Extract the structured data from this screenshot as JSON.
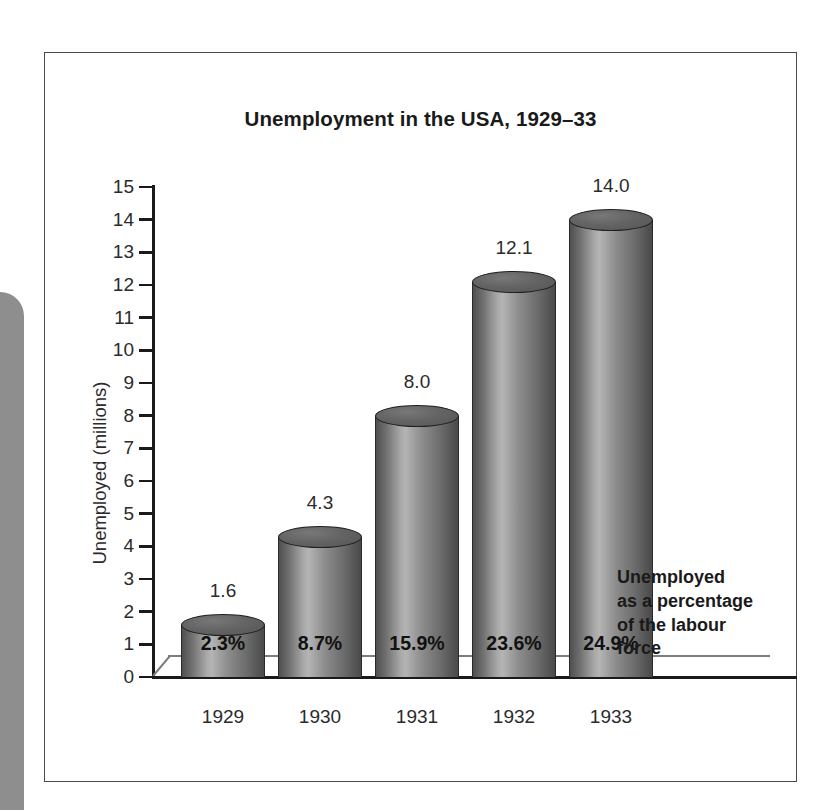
{
  "figure": {
    "title": "Unemployment in the USA, 1929–33",
    "annotation_lines": [
      "Unemployed",
      "as a percentage",
      "of the labour",
      "force"
    ],
    "frame_color": "#4a4a4a",
    "bar_dark": "#4f4f4f",
    "bar_light": "#b4b4b4",
    "text_color": "#2b2b2b"
  },
  "chart_data": {
    "type": "bar",
    "title": "Unemployment in the USA, 1929–33",
    "xlabel": "",
    "ylabel": "Unemployed (millions)",
    "ylim": [
      0,
      15
    ],
    "grid": false,
    "legend": null,
    "categories": [
      "1929",
      "1930",
      "1931",
      "1932",
      "1933"
    ],
    "values": [
      1.6,
      4.3,
      8.0,
      12.1,
      14.0
    ],
    "value_labels": [
      "1.6",
      "4.3",
      "8.0",
      "12.1",
      "14.0"
    ],
    "secondary_labels": [
      "2.3%",
      "8.7%",
      "15.9%",
      "23.6%",
      "24.9%"
    ],
    "secondary_label_note": "Unemployed as a percentage of the labour force",
    "y_ticks": [
      15,
      14,
      13,
      12,
      11,
      10,
      9,
      8,
      7,
      6,
      5,
      4,
      3,
      2,
      1,
      0
    ],
    "y_tick_labels": [
      "15",
      "14",
      "13",
      "12",
      "11",
      "10",
      "9",
      "8",
      "7",
      "6",
      "5",
      "4",
      "3",
      "2",
      "1",
      "0"
    ]
  }
}
